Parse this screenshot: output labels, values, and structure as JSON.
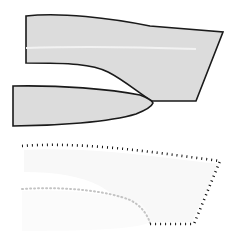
{
  "canvas": {
    "width": 238,
    "height": 242,
    "background": "#ffffff",
    "title": "Shape outline comparison diagram"
  },
  "palette": {
    "fill_gray": "#dcdcdc",
    "fill_gray_light": "#e6e6e6",
    "highlight_band": "#f0f0f0",
    "stroke_dark": "#1a1a1a",
    "dotted_dark": "#111111",
    "dotted_faint": "#c8c8c8",
    "ghost_fill": "#f7f7f7",
    "ghost_fill_2": "#fafafa"
  },
  "panels": [
    {
      "id": "solid-panel",
      "label": "Solid filled shapes",
      "y_range": [
        10,
        118
      ]
    },
    {
      "id": "outline-panel",
      "label": "Dotted outline shapes",
      "y_range": [
        138,
        232
      ]
    }
  ],
  "shapes": {
    "upper_body": {
      "name": "upper-wedge-shape",
      "label": "Upper wedge body",
      "fill": "#dcdcdc",
      "stroke": "#1a1a1a",
      "stroke_width": 1.6,
      "path": "M 26,16 C 60,12 110,18 150,26 L 223,32 L 196,101 L 152,101 C 140,94 124,80 108,72 C 92,64 70,63 26,63 Z"
    },
    "upper_band": {
      "name": "upper-highlight-band",
      "label": "Horizontal highlight band",
      "stroke": "#f2f2f2",
      "stroke_width": 2.0,
      "path": "M 26,48 C 80,46 140,47 196,49"
    },
    "lower_body": {
      "name": "lower-blade-shape",
      "label": "Lower blade body",
      "fill": "#dcdcdc",
      "stroke": "#1a1a1a",
      "stroke_width": 1.6,
      "path": "M 13,86 C 60,85 110,89 140,95 C 148,98 152,101 153,103 C 152,106 146,110 136,114 C 110,122 55,126 13,126 Z"
    },
    "dotted_outline": {
      "name": "dotted-outline-polygon",
      "label": "Dotted boundary polygon",
      "stroke": "#111111",
      "stroke_width": 2.6,
      "dash": "1 4",
      "path": "M 22,146 C 70,142 130,149 175,155 L 220,161 L 194,224 L 150,224"
    },
    "dotted_inner": {
      "name": "dotted-inner-curve",
      "label": "Faint inner dotted curve",
      "stroke": "#c4c4c4",
      "stroke_width": 2.0,
      "dash": "1 3",
      "path": "M 22,189 C 70,186 110,192 130,200 C 142,206 148,216 150,223"
    },
    "ghost_upper": {
      "name": "ghost-upper-shape",
      "label": "Faint ghost of upper shape",
      "fill": "#f8f8f8",
      "path": "M 24,150 C 70,147 130,153 176,159 L 218,164 L 192,222 L 150,222 C 138,214 120,198 100,186 C 80,176 56,172 24,172 Z"
    },
    "ghost_lower": {
      "name": "ghost-lower-shape",
      "label": "Faint ghost of lower blade",
      "fill": "#fbfbfb",
      "path": "M 22,191 C 66,189 112,194 138,202 C 146,205 150,219 151,222 C 140,228 100,231 22,231 Z"
    }
  },
  "geometry": {
    "upper_vertices": [
      {
        "name": "upper-left-top",
        "x": 26,
        "y": 16
      },
      {
        "name": "upper-right-tip",
        "x": 223,
        "y": 32
      },
      {
        "name": "upper-right-bottom",
        "x": 196,
        "y": 101
      },
      {
        "name": "notch-point",
        "x": 152,
        "y": 101
      },
      {
        "name": "upper-left-bottom",
        "x": 26,
        "y": 63
      }
    ],
    "lower_vertices": [
      {
        "name": "lower-left-top",
        "x": 13,
        "y": 86
      },
      {
        "name": "lower-tip",
        "x": 153,
        "y": 103
      },
      {
        "name": "lower-left-bottom",
        "x": 13,
        "y": 126
      }
    ],
    "dotted_vertices": [
      {
        "name": "dotted-left-top",
        "x": 22,
        "y": 146
      },
      {
        "name": "dotted-right-top",
        "x": 220,
        "y": 161
      },
      {
        "name": "dotted-right-bottom",
        "x": 194,
        "y": 224
      },
      {
        "name": "dotted-bottom-left",
        "x": 150,
        "y": 224
      }
    ]
  }
}
